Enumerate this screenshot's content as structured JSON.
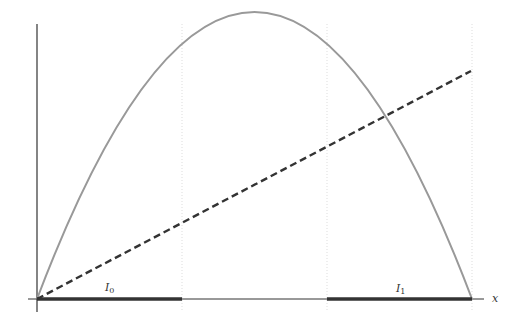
{
  "diagram": {
    "type": "function-plot",
    "x_axis_label": "x",
    "interval_labels": [
      {
        "name": "I",
        "subscript": "0"
      },
      {
        "name": "I",
        "subscript": "1"
      }
    ],
    "curves": [
      {
        "name": "parabola",
        "style": "solid",
        "color": "#999999",
        "description": "concave-down parabola through origin and right endpoint"
      },
      {
        "name": "line",
        "style": "dashed",
        "color": "#333333",
        "description": "straight line through origin"
      }
    ],
    "gridlines": {
      "count": 3,
      "style": "dotted"
    },
    "colors": {
      "axis": "#333333",
      "grid": "#dddddd",
      "interval": "#333333",
      "parabola": "#999999",
      "line": "#333333"
    }
  }
}
